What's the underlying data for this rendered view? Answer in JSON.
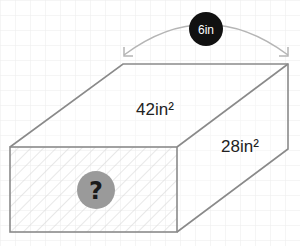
{
  "diagram": {
    "type": "rectangular-prism",
    "top_face_label": "42in²",
    "right_face_label": "28in²",
    "front_face_label": "?",
    "depth_label": "6in",
    "colors": {
      "grid": "#ececec",
      "edge": "#8a8a8a",
      "hatch": "#d6d6d6",
      "arrow": "#b5b5b5",
      "badge_dark": "#111111",
      "question_circle": "#9a9a9a",
      "text": "#222222"
    }
  }
}
